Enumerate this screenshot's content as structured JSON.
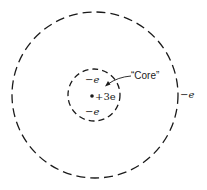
{
  "diagram": {
    "type": "atomic-shell-model",
    "colors": {
      "stroke": "#1a1a1a",
      "background": "#ffffff"
    },
    "outer_shell": {
      "cx": 95,
      "cy": 95,
      "r": 83,
      "electron_label": "−e"
    },
    "inner_shell": {
      "cx": 94,
      "cy": 95,
      "r": 26
    },
    "nucleus": {
      "charge_label": "+3e"
    },
    "core_electrons": [
      {
        "label": "−e"
      },
      {
        "label": "−e"
      }
    ],
    "core_annotation": {
      "label": "“Core”"
    }
  }
}
